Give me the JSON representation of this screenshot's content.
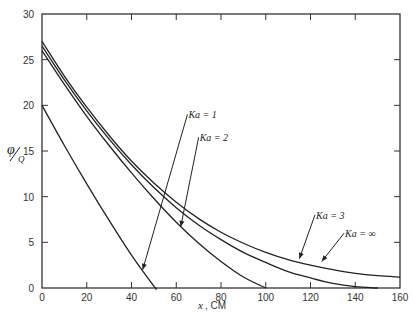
{
  "chart_data": {
    "type": "line",
    "title": "",
    "xlabel": "x, CM",
    "ylabel": "φ/Q",
    "xlim": [
      0,
      160
    ],
    "ylim": [
      0,
      30
    ],
    "x_ticks": [
      0,
      20,
      40,
      60,
      80,
      100,
      120,
      140,
      160
    ],
    "y_ticks": [
      0,
      5,
      10,
      15,
      20,
      25,
      30
    ],
    "grid": false,
    "legend": "annotations with arrows",
    "series": [
      {
        "name": "Ka = 1",
        "x": [
          0,
          10,
          20,
          30,
          40,
          50,
          51
        ],
        "y": [
          20,
          15.6,
          11.4,
          7.4,
          3.6,
          0.2,
          0
        ]
      },
      {
        "name": "Ka = 2",
        "x": [
          0,
          10,
          20,
          30,
          40,
          50,
          60,
          70,
          80,
          90,
          100
        ],
        "y": [
          26,
          22.3,
          18.8,
          15.6,
          12.6,
          9.8,
          7.2,
          4.9,
          2.9,
          1.2,
          0
        ]
      },
      {
        "name": "Ka = 3",
        "x": [
          0,
          10,
          20,
          30,
          40,
          50,
          60,
          70,
          80,
          90,
          100,
          110,
          120,
          130,
          140,
          150
        ],
        "y": [
          26.5,
          22.8,
          19.4,
          16.3,
          13.5,
          11.0,
          8.8,
          6.9,
          5.3,
          3.9,
          2.8,
          1.8,
          1.1,
          0.5,
          0.15,
          0
        ]
      },
      {
        "name": "Ka = ∞",
        "x": [
          0,
          10,
          20,
          30,
          40,
          50,
          60,
          70,
          80,
          90,
          100,
          110,
          120,
          130,
          140,
          150,
          160
        ],
        "y": [
          27,
          23.2,
          19.8,
          16.7,
          13.9,
          11.5,
          9.4,
          7.6,
          6.1,
          4.9,
          3.9,
          3.1,
          2.5,
          2.0,
          1.6,
          1.35,
          1.2
        ]
      }
    ],
    "annotations": [
      {
        "text": "Ka = 1",
        "label_pos": [
          65,
          19
        ],
        "arrow_to": [
          45,
          2
        ]
      },
      {
        "text": "Ka = 2",
        "label_pos": [
          70,
          16.5
        ],
        "arrow_to": [
          62,
          6.7
        ]
      },
      {
        "text": "Ka = 3",
        "label_pos": [
          122,
          8
        ],
        "arrow_to": [
          115,
          3.2
        ]
      },
      {
        "text": "Ka = ∞",
        "label_pos": [
          135,
          6
        ],
        "arrow_to": [
          125,
          2.9
        ]
      }
    ]
  },
  "axis": {
    "x_title_var": "x",
    "x_title_unit": ", CM",
    "y_title_num": "φ",
    "y_title_den": "Q"
  }
}
